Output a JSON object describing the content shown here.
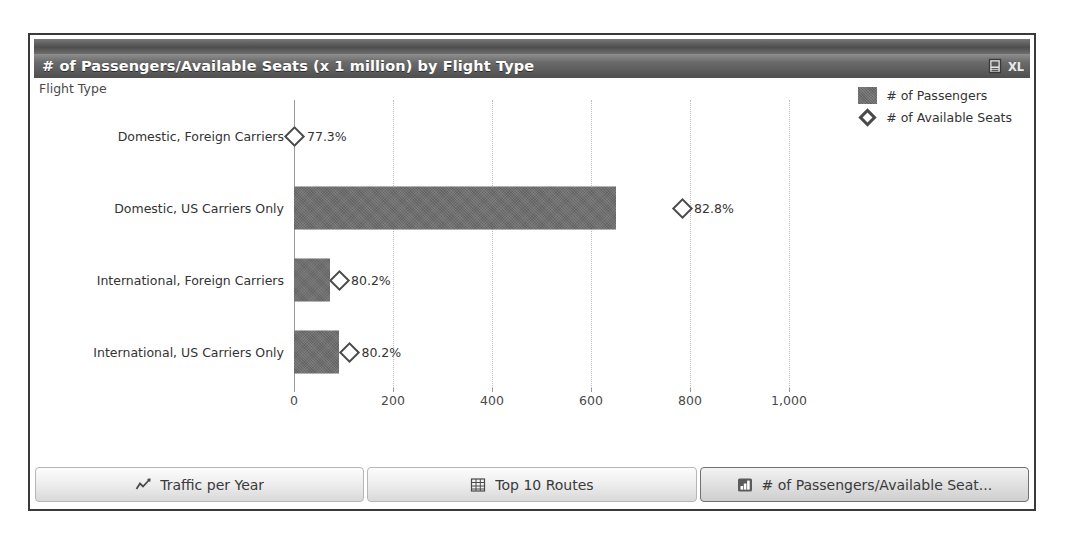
{
  "window": {
    "titlebar": {
      "title": "# of Passengers/Available Seats (x 1 million) by Flight Type",
      "actions": [
        {
          "name": "report-icon",
          "label": "Report"
        },
        {
          "name": "excel-export-icon",
          "label": "XL"
        }
      ]
    }
  },
  "chart_data": {
    "type": "bar",
    "orientation": "horizontal",
    "title": "# of Passengers/Available Seats (x 1 million) by Flight Type",
    "xlabel": "",
    "ylabel": "Flight Type",
    "categories": [
      "Domestic, Foreign Carriers",
      "Domestic, US Carriers Only",
      "International, Foreign Carriers",
      "International, US Carriers Only"
    ],
    "series": [
      {
        "name": "# of Passengers",
        "type": "bar",
        "values": [
          1.5,
          650,
          73,
          90
        ]
      },
      {
        "name": "# of Available Seats",
        "type": "marker",
        "values": [
          2,
          784,
          91,
          112
        ],
        "data_labels": [
          "77.3%",
          "82.8%",
          "80.2%",
          "80.2%"
        ]
      }
    ],
    "xlim": [
      0,
      1100
    ],
    "xticks": [
      0,
      200,
      400,
      600,
      800,
      1000
    ],
    "xticklabels": [
      "0",
      "200",
      "400",
      "600",
      "800",
      "1,000"
    ],
    "grid": true,
    "legend_position": "top-right",
    "legend": [
      "# of Passengers",
      "# of Available Seats"
    ],
    "colors": {
      "bar": "#6e6e6e",
      "marker_outline": "#4a4a4a",
      "gridline": "#bdbdbd",
      "axis": "#9a9a9a",
      "text": "#333333"
    }
  },
  "tabs": [
    {
      "label": "Traffic per Year",
      "icon": "line-chart-icon",
      "active": false
    },
    {
      "label": "Top 10 Routes",
      "icon": "table-grid-icon",
      "active": false
    },
    {
      "label": "# of Passengers/Available Seat...",
      "icon": "bar-chart-icon",
      "active": true
    }
  ]
}
